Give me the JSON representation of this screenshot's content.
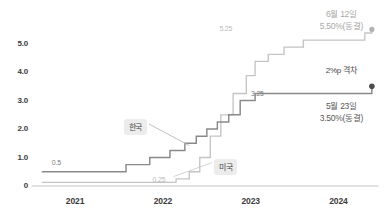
{
  "chart_data": {
    "type": "line",
    "title": "",
    "subtitle": "",
    "xlabel": "",
    "ylabel": "",
    "xlim": [
      2020.6,
      2024.45
    ],
    "ylim": [
      0,
      5.9
    ],
    "grid": false,
    "legend_position": "inline-callout",
    "yticks": [
      "0",
      "1.0",
      "2.0",
      "3.0",
      "4.0",
      "5.0"
    ],
    "ytick_values": [
      0,
      1.0,
      2.0,
      3.0,
      4.0,
      5.0
    ],
    "xticks": [
      "2021",
      "2022",
      "2023",
      "2024"
    ],
    "xtick_values": [
      2021,
      2022,
      2023,
      2024
    ],
    "series": [
      {
        "name": "한국",
        "color": "#8a8a8a",
        "step": "post",
        "end_marker": "dot",
        "x": [
          2020.62,
          2021.58,
          2021.85,
          2022.08,
          2022.25,
          2022.38,
          2022.5,
          2022.62,
          2022.75,
          2022.88,
          2023.05,
          2024.38
        ],
        "values": [
          0.5,
          0.75,
          1.0,
          1.25,
          1.5,
          1.75,
          2.0,
          2.25,
          2.5,
          3.0,
          3.25,
          3.5
        ]
      },
      {
        "name": "미국",
        "color": "#c4c4c4",
        "step": "post",
        "end_marker": "circle",
        "x": [
          2020.62,
          2022.15,
          2022.3,
          2022.42,
          2022.54,
          2022.66,
          2022.8,
          2022.95,
          2023.05,
          2023.2,
          2023.38,
          2023.6,
          2024.3,
          2024.38
        ],
        "values": [
          0.125,
          0.25,
          0.5,
          1.0,
          1.75,
          2.5,
          3.25,
          3.875,
          4.375,
          4.625,
          4.875,
          5.125,
          5.375,
          5.5
        ]
      }
    ],
    "data_labels": [
      {
        "text": "0.5",
        "series": "한국",
        "value": 0.5
      },
      {
        "text": "0.25",
        "series": "미국",
        "value": 0.25
      },
      {
        "text": "5.25",
        "series": "미국",
        "value": 5.25
      },
      {
        "text": "3.25",
        "series": "한국",
        "value": 3.25
      }
    ],
    "series_tags": [
      {
        "text": "한국",
        "series": "한국"
      },
      {
        "text": "미국",
        "series": "미국"
      }
    ],
    "annotations": [
      {
        "id": "us-latest",
        "line1": "6월 12일",
        "line2": "5.50%(동결)",
        "series": "미국",
        "value": 5.5
      },
      {
        "id": "gap",
        "line1": "2%p 격차",
        "line2": "",
        "value": 2.0
      },
      {
        "id": "kr-latest",
        "line1": "5월 23일",
        "line2": "3.50%(동결)",
        "series": "한국",
        "value": 3.5
      }
    ]
  },
  "colors": {
    "korea_line": "#8a8a8a",
    "usa_line": "#c4c4c4",
    "axis": "#d8d8d8",
    "tick_text": "#3b3b3b",
    "tag_bg": "#ececec"
  }
}
